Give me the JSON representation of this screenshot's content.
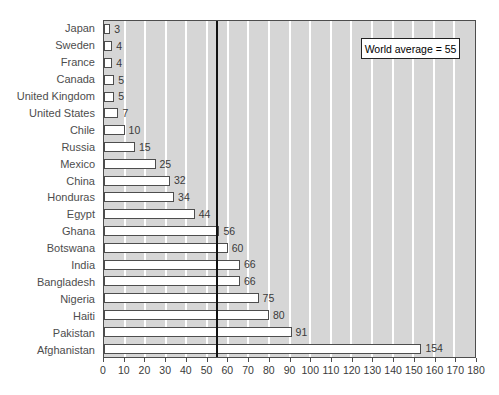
{
  "chart_data": {
    "type": "bar",
    "orientation": "horizontal",
    "title": "",
    "categories": [
      "Japan",
      "Sweden",
      "France",
      "Canada",
      "United Kingdom",
      "United States",
      "Chile",
      "Russia",
      "Mexico",
      "China",
      "Honduras",
      "Egypt",
      "Ghana",
      "Botswana",
      "India",
      "Bangladesh",
      "Nigeria",
      "Haiti",
      "Pakistan",
      "Afghanistan"
    ],
    "values": [
      3,
      4,
      4,
      5,
      5,
      7,
      10,
      15,
      25,
      32,
      34,
      44,
      56,
      60,
      66,
      66,
      75,
      80,
      91,
      154
    ],
    "xlim": [
      0,
      180
    ],
    "xticks": [
      0,
      10,
      20,
      30,
      40,
      50,
      60,
      70,
      80,
      90,
      100,
      110,
      120,
      130,
      140,
      150,
      160,
      170,
      180
    ],
    "gridlines_x": [
      10,
      20,
      30,
      40,
      50,
      60,
      70,
      80,
      90,
      100,
      110,
      120,
      130,
      140,
      150,
      160,
      170
    ],
    "grid": "vertical",
    "legend": "none",
    "reference_line": {
      "value": 55,
      "label": "World average = 55"
    },
    "colors": {
      "plot_bg": "#d6d6d6",
      "bar_fill": "#ffffff",
      "bar_border": "#4d4d4d",
      "gridline": "#ffffff",
      "reference_line": "#111111",
      "axis_text": "#3a3a3a",
      "label_text": "#4d4d4d",
      "tick": "#4d4d4d"
    }
  }
}
